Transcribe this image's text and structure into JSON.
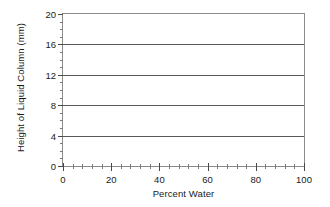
{
  "chart_data": {
    "type": "line",
    "title": "",
    "subtitle": "",
    "xlabel": "Percent Water",
    "ylabel": "Height of Liquid Column (mm)",
    "xlim": [
      0,
      100
    ],
    "ylim": [
      0,
      20
    ],
    "x_ticks": [
      0,
      20,
      40,
      60,
      80,
      100
    ],
    "x_tick_labels": [
      "0",
      "20",
      "40",
      "60",
      "80",
      "100"
    ],
    "x_minor_tick_interval": 4,
    "y_ticks": [
      0,
      4,
      8,
      12,
      16,
      20
    ],
    "y_tick_labels": [
      "0",
      "4",
      "8",
      "12",
      "16",
      "20"
    ],
    "y_minor_tick_interval": 1,
    "grid": "horizontal-major",
    "gridlines_y": [
      4,
      8,
      12,
      16,
      20
    ],
    "legend": null,
    "legend_position": "none",
    "series": [],
    "values": [],
    "annotations": [],
    "note": "Empty axes template: no data series plotted"
  },
  "colors": {
    "background": "#ffffff",
    "frame": "#8b8b8b",
    "gridline": "#5a5a5a",
    "tick_major": "#4a4a4a",
    "tick_minor": "#7a7a7a",
    "text": "#1a1a1a"
  }
}
